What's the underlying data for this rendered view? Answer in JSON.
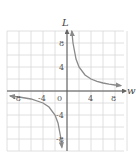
{
  "chart_data": {
    "type": "line",
    "title": "",
    "xlabel": "w",
    "ylabel": "L",
    "xlim": [
      -10,
      10
    ],
    "ylim": [
      -10,
      10
    ],
    "grid": true,
    "grid_step": 2,
    "x_ticks": [
      -8,
      -4,
      0,
      4,
      8
    ],
    "y_ticks": [
      8,
      4,
      -4,
      -8
    ],
    "x_tick_labels": [
      "-8",
      "-4",
      "0",
      "4",
      "8"
    ],
    "y_tick_labels": [
      "8",
      "4",
      "-4",
      "-8"
    ],
    "series": [
      {
        "name": "L = 8/w (w > 0)",
        "x": [
          0.8,
          1,
          1.5,
          2,
          3,
          4,
          5,
          6,
          7,
          8,
          9
        ],
        "y": [
          10,
          8,
          5.33,
          4,
          2.67,
          2,
          1.6,
          1.33,
          1.14,
          1,
          0.89
        ]
      },
      {
        "name": "L = 8/w (w < 0)",
        "x": [
          -9.5,
          -8,
          -6,
          -4,
          -3,
          -2,
          -1.5,
          -1,
          -0.85
        ],
        "y": [
          -0.84,
          -1,
          -1.33,
          -2,
          -2.67,
          -4,
          -5.33,
          -8,
          -9.4
        ]
      }
    ],
    "colors": {
      "curve": "#8a8a8a",
      "axis": "#555555",
      "grid": "#d8d8d8"
    },
    "legend": null
  },
  "labels": {
    "x_axis": "w",
    "y_axis": "L",
    "ticks": {
      "x_m8": "-8",
      "x_m4": "-4",
      "x_0": "0",
      "x_4": "4",
      "x_8": "8",
      "y_8": "8",
      "y_4": "4",
      "y_m4": "-4",
      "y_m8": "-8"
    }
  }
}
